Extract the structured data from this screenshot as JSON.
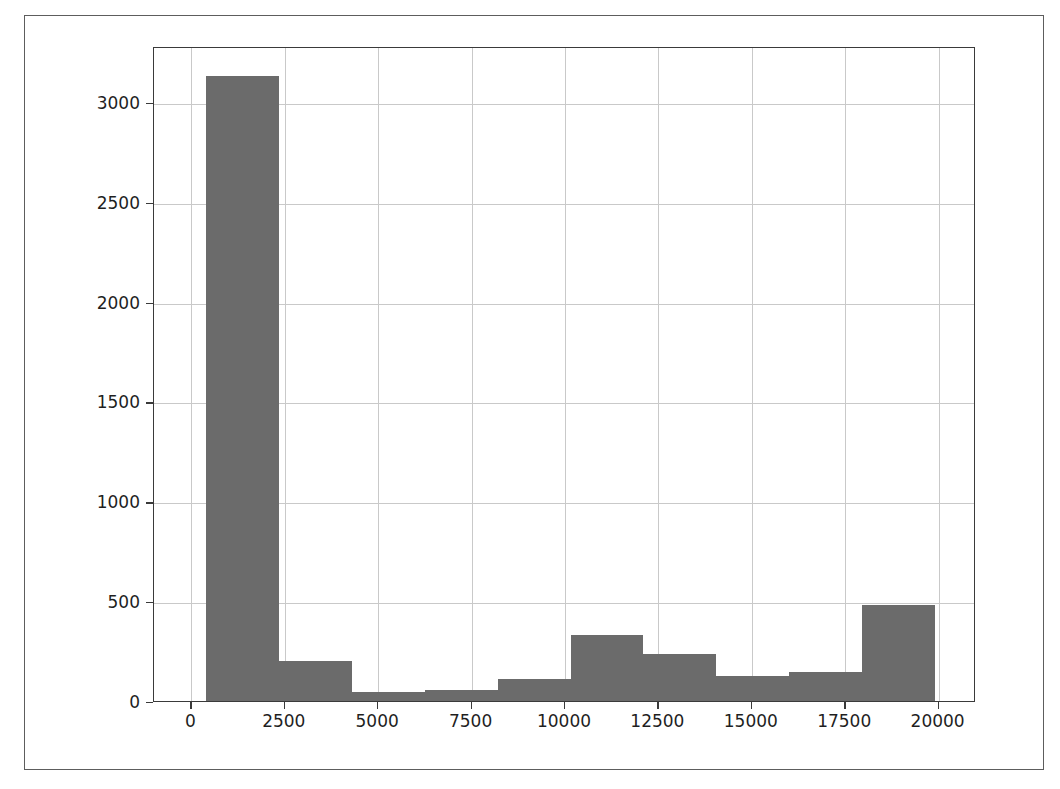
{
  "figure": {
    "background_color": "#ffffff",
    "frame_color": "#5d5d5d",
    "axes_color": "#3a3a3a",
    "grid_color": "#c9c9c9",
    "bar_color": "#6b6b6b"
  },
  "chart_data": {
    "type": "bar",
    "chart_style": "histogram",
    "title": "",
    "xlabel": "",
    "ylabel": "",
    "xlim": [
      -1000,
      21000
    ],
    "ylim": [
      0,
      3280
    ],
    "grid": true,
    "legend": "none",
    "xticks": [
      "0",
      "2500",
      "5000",
      "7500",
      "10000",
      "12500",
      "15000",
      "17500",
      "20000"
    ],
    "xtick_values": [
      0,
      2500,
      5000,
      7500,
      10000,
      12500,
      15000,
      17500,
      20000
    ],
    "yticks": [
      "0",
      "500",
      "1000",
      "1500",
      "2000",
      "2500",
      "3000"
    ],
    "ytick_values": [
      0,
      500,
      1000,
      1500,
      2000,
      2500,
      3000
    ],
    "bin_edges": [
      400,
      2350,
      4300,
      6250,
      8200,
      10150,
      12100,
      14050,
      16000,
      17950,
      19900
    ],
    "categories": [
      "400-2350",
      "2350-4300",
      "4300-6250",
      "6250-8200",
      "8200-10150",
      "10150-12100",
      "12100-14050",
      "14050-16000",
      "16000-17950",
      "17950-19900"
    ],
    "values": [
      3130,
      200,
      45,
      55,
      110,
      330,
      235,
      125,
      145,
      480
    ]
  }
}
